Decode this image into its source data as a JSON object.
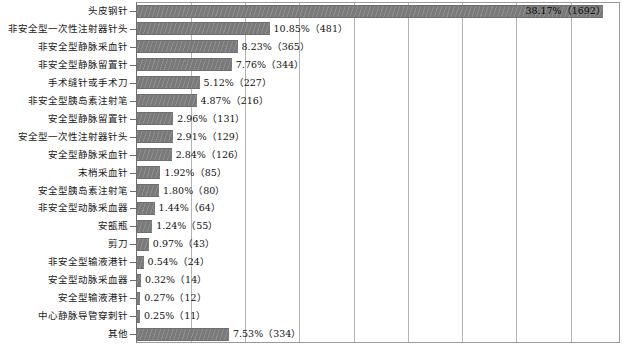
{
  "chart_data": {
    "type": "bar",
    "orientation": "horizontal",
    "title": "",
    "subtitle": "",
    "xlabel": "",
    "ylabel": "",
    "xlim": [
      0,
      39.5
    ],
    "grid": true,
    "gridlines_percent": [
      4.4,
      8.9,
      13.3,
      17.8,
      22.2,
      26.7,
      31.1,
      35.5
    ],
    "legend": "none",
    "bar_color": "#808080",
    "categories": [
      "头皮钢针",
      "非安全型一次性注射器针头",
      "非安全型静脉采血针",
      "非安全型静脉留置针",
      "手术缝针或手术刀",
      "非安全型胰岛素注射笔",
      "安全型静脉留置针",
      "安全型一次性注射器针头",
      "安全型静脉采血针",
      "末梢采血针",
      "安全型胰岛素注射笔",
      "非安全型动脉采血器",
      "安瓿瓶",
      "剪刀",
      "非安全型输液港针",
      "安全型动脉采血器",
      "安全型输液港针",
      "中心静脉导管穿刺针",
      "其他"
    ],
    "values": [
      38.17,
      10.85,
      8.23,
      7.76,
      5.12,
      4.87,
      2.96,
      2.91,
      2.84,
      1.92,
      1.8,
      1.44,
      1.24,
      0.97,
      0.54,
      0.32,
      0.27,
      0.25,
      7.53
    ],
    "counts": [
      1692,
      481,
      365,
      344,
      227,
      216,
      131,
      129,
      126,
      85,
      80,
      64,
      55,
      43,
      24,
      14,
      12,
      11,
      334
    ],
    "data_labels": [
      "38.17%（1692）",
      "10.85%（481）",
      "8.23%（365）",
      "7.76%（344）",
      "5.12%（227）",
      "4.87%（216）",
      "2.96%（131）",
      "2.91%（129）",
      "2.84%（126）",
      "1.92%（85）",
      "1.80%（80）",
      "1.44%（64）",
      "1.24%（55）",
      "0.97%（43）",
      "0.54%（24）",
      "0.32%（14）",
      "0.27%（12）",
      "0.25%（11）",
      "7.53%（334）"
    ]
  }
}
